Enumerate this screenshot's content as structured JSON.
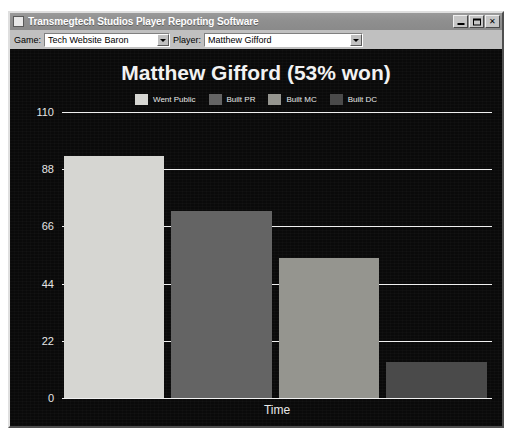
{
  "window": {
    "title": "Transmegtech Studios Player Reporting Software",
    "icon": "app-icon",
    "buttons": {
      "minimize": "_",
      "maximize": "□",
      "close": "✕"
    }
  },
  "toolbar": {
    "game_label": "Game:",
    "game_value": "Tech Website Baron",
    "player_label": "Player:",
    "player_value": "Matthew Gifford"
  },
  "chart_data": {
    "type": "bar",
    "title": "Matthew Gifford (53% won)",
    "xlabel": "Time",
    "ylabel": "",
    "categories": [
      "Went Public",
      "Built PR",
      "Built MC",
      "Built DC"
    ],
    "values": [
      93,
      72,
      54,
      14
    ],
    "ylim": [
      0,
      110
    ],
    "yticks": [
      110,
      88,
      66,
      44,
      22,
      0
    ],
    "grid": true,
    "legend_position": "top",
    "legend": [
      {
        "label": "Went Public",
        "color": "#d6d6d2"
      },
      {
        "label": "Built PR",
        "color": "#646464"
      },
      {
        "label": "Built MC",
        "color": "#95958f"
      },
      {
        "label": "Built DC",
        "color": "#4a4a4a"
      }
    ],
    "background_color": "#0a0a0a",
    "gridline_color": "#f0f0f0",
    "text_color": "#eeeeee"
  }
}
